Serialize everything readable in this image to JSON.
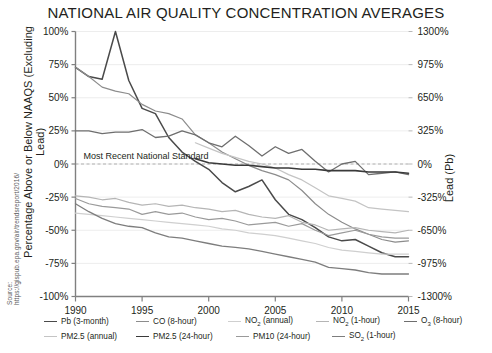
{
  "chart_data": {
    "type": "line",
    "title": "NATIONAL AIR QUALITY CONCENTRATION AVERAGES",
    "xlabel": "",
    "ylabel": "Percentage Above or Below NAAQS (Excluding Lead)",
    "ylabel_right": "Lead (Pb)",
    "source": "Source: https://gispub.epa.gov/air/trendsreport/2016/",
    "annotation": "Most Recent National Standard",
    "xlim": [
      1990,
      2015
    ],
    "ylim": [
      -100,
      100
    ],
    "ylim_right": [
      -1300,
      1300
    ],
    "grid": true,
    "legend_position": "bottom",
    "xticks": [
      "1990",
      "1995",
      "2000",
      "2005",
      "2010",
      "2015"
    ],
    "xtick_values": [
      1990,
      1995,
      2000,
      2005,
      2010,
      2015
    ],
    "yticks": [
      "100%",
      "75%",
      "50%",
      "25%",
      "0%",
      "-25%",
      "-50%",
      "-75%",
      "-100%"
    ],
    "ytick_values": [
      100,
      75,
      50,
      25,
      0,
      -25,
      -50,
      -75,
      -100
    ],
    "yticks_right": [
      "1300%",
      "975%",
      "650%",
      "325%",
      "0%",
      "-325%",
      "-650%",
      "-975%",
      "-1300%"
    ],
    "ytick_right_values": [
      1300,
      975,
      650,
      325,
      0,
      -325,
      -650,
      -975,
      -1300
    ],
    "x": [
      1990,
      1991,
      1992,
      1993,
      1994,
      1995,
      1996,
      1997,
      1998,
      1999,
      2000,
      2001,
      2002,
      2003,
      2004,
      2005,
      2006,
      2007,
      2008,
      2009,
      2010,
      2011,
      2012,
      2013,
      2014,
      2015
    ],
    "series": [
      {
        "name": "Pb (3-month)",
        "axis": "right",
        "color": "#4a4a4a",
        "width": 1.5,
        "values": [
          73,
          66,
          64,
          100,
          63,
          42,
          38,
          20,
          9,
          2,
          -4,
          -14,
          -21,
          -17,
          -12,
          -27,
          -38,
          -42,
          -48,
          -55,
          -58,
          -57,
          -62,
          -67,
          -70,
          -70
        ]
      },
      {
        "name": "CO (8-hour)",
        "axis": "left",
        "color": "#8c8c8c",
        "width": 1.2,
        "values": [
          73,
          66,
          58,
          55,
          53,
          45,
          40,
          38,
          34,
          22,
          16,
          9,
          4,
          -1,
          -5,
          -8,
          -12,
          -20,
          -30,
          -38,
          -44,
          -49,
          -53,
          -57,
          -59,
          -58
        ]
      },
      {
        "name": "NO2 (annual)",
        "axis": "left",
        "color": "#cfcfcf",
        "width": 1.2,
        "values": [
          -37,
          -38,
          -39,
          -40,
          -41,
          -42,
          -43,
          -44,
          -45,
          -46,
          -47,
          -49,
          -50,
          -52,
          -53,
          -54,
          -56,
          -58,
          -60,
          -63,
          -65,
          -66,
          -67,
          -68,
          -68,
          -68
        ]
      },
      {
        "name": "NO2 (1-hour)",
        "axis": "left",
        "color": "#b5b5b5",
        "width": 1.2,
        "values": [
          -24,
          -25,
          -27,
          -26,
          -29,
          -31,
          -30,
          -32,
          -31,
          -33,
          -34,
          -36,
          -35,
          -38,
          -40,
          -41,
          -39,
          -44,
          -46,
          -50,
          -49,
          -48,
          -50,
          -51,
          -52,
          -50
        ]
      },
      {
        "name": "O3 (8-hour)",
        "axis": "left",
        "color": "#6e6e6e",
        "width": 1.3,
        "values": [
          25,
          25,
          23,
          24,
          24,
          26,
          20,
          21,
          25,
          22,
          16,
          13,
          21,
          14,
          6,
          13,
          8,
          11,
          2,
          -6,
          0,
          2,
          -8,
          -7,
          -6,
          -8
        ]
      },
      {
        "name": "PM2.5 (annual)",
        "axis": "left",
        "color": "#c4c4c4",
        "width": 1.2,
        "values": [
          null,
          null,
          null,
          null,
          null,
          null,
          null,
          null,
          null,
          16,
          12,
          8,
          5,
          2,
          0,
          -3,
          -8,
          -12,
          -18,
          -24,
          -26,
          -28,
          -33,
          -34,
          -35,
          -36
        ]
      },
      {
        "name": "PM2.5 (24-hour)",
        "axis": "left",
        "color": "#3a3a3a",
        "width": 1.6,
        "values": [
          null,
          null,
          null,
          null,
          null,
          null,
          null,
          null,
          null,
          4,
          1,
          0,
          -1,
          -1,
          -2,
          -3,
          -3,
          -4,
          -4,
          -5,
          -5,
          -5,
          -6,
          -6,
          -6,
          -7
        ]
      },
      {
        "name": "PM10 (24-hour)",
        "axis": "left",
        "color": "#9a9a9a",
        "width": 1.2,
        "values": [
          -26,
          -30,
          -32,
          -33,
          -34,
          -38,
          -36,
          -38,
          -37,
          -40,
          -42,
          -41,
          -43,
          -46,
          -45,
          -44,
          -47,
          -45,
          -50,
          -54,
          -52,
          -50,
          -53,
          -55,
          -56,
          -56
        ]
      },
      {
        "name": "SO2 (1-hour)",
        "axis": "left",
        "color": "#7d7d7d",
        "width": 1.3,
        "values": [
          -30,
          -36,
          -41,
          -45,
          -47,
          -48,
          -52,
          -55,
          -56,
          -58,
          -60,
          -62,
          -63,
          -64,
          -66,
          -68,
          -70,
          -72,
          -74,
          -78,
          -79,
          -80,
          -82,
          -83,
          -83,
          -83
        ]
      }
    ]
  },
  "legend": {
    "rows": [
      [
        {
          "label_html": "Pb (3-month)",
          "color": "#4a4a4a"
        },
        {
          "label_html": "CO (8-hour)",
          "color": "#8c8c8c"
        },
        {
          "label_html": "NO<sub>2</sub> (annual)",
          "color": "#cfcfcf"
        },
        {
          "label_html": "NO<sub>2</sub> (1-hour)",
          "color": "#b5b5b5"
        },
        {
          "label_html": "O<sub>3</sub> (8-hour)",
          "color": "#6e6e6e"
        }
      ],
      [
        {
          "label_html": "PM2.5 (annual)",
          "color": "#c4c4c4"
        },
        {
          "label_html": "PM2.5 (24-hour)",
          "color": "#3a3a3a"
        },
        {
          "label_html": "PM10 (24-hour)",
          "color": "#9a9a9a"
        },
        {
          "label_html": "SO<sub>2</sub> (1-hour)",
          "color": "#7d7d7d"
        }
      ]
    ]
  }
}
